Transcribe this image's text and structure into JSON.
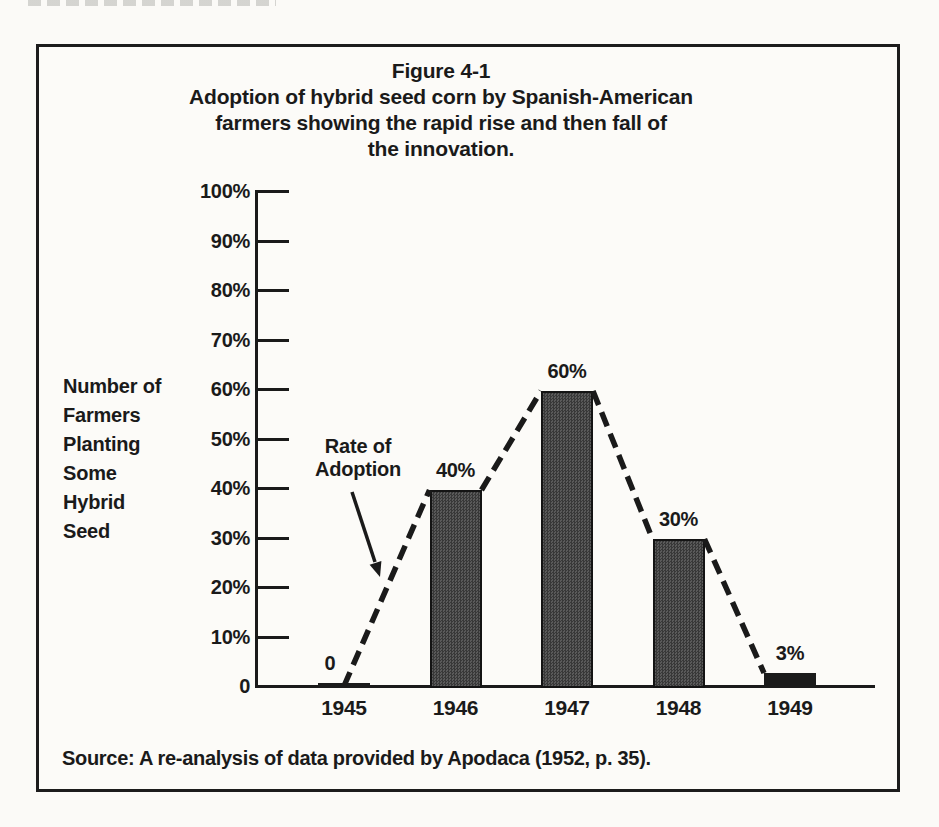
{
  "figure": {
    "number": "Figure 4-1",
    "caption_lines": [
      "Adoption of hybrid seed corn by Spanish-American",
      "farmers showing the rapid rise and then fall of",
      "the innovation."
    ],
    "source": "Source: A re-analysis of data provided by Apodaca (1952, p. 35)."
  },
  "chart_data": {
    "type": "bar",
    "title": "Figure 4-1",
    "subtitle": "Adoption of hybrid seed corn by Spanish-American farmers showing the rapid rise and then fall of the innovation.",
    "ylabel": "Number of Farmers Planting Some Hybrid Seed",
    "ylabel_lines": [
      "Number of",
      "Farmers",
      "Planting",
      "Some",
      "Hybrid",
      "Seed"
    ],
    "categories": [
      "1945",
      "1946",
      "1947",
      "1948",
      "1949"
    ],
    "values": [
      0,
      40,
      60,
      30,
      3
    ],
    "bar_labels": [
      "0",
      "40%",
      "60%",
      "30%",
      "3%"
    ],
    "yticks": [
      0,
      10,
      20,
      30,
      40,
      50,
      60,
      70,
      80,
      90,
      100
    ],
    "ytick_labels": [
      "0",
      "10%",
      "20%",
      "30%",
      "40%",
      "50%",
      "60%",
      "70%",
      "80%",
      "90%",
      "100%"
    ],
    "ylim": [
      0,
      100
    ],
    "grid": "off",
    "legend": "none",
    "annotation": {
      "label_lines": [
        "Rate of",
        "Adoption"
      ],
      "target": "dashed adoption curve"
    },
    "overlay_line": {
      "style": "dashed",
      "description": "Rate of Adoption curve connecting bar tops from 0% in 1945 up to 60% in 1947 and down to 3% in 1949"
    },
    "source": "Source: A re-analysis of data provided by Apodaca (1952, p. 35).",
    "colors": {
      "ink": "#1a1a1a",
      "bar_fill": "#4a4a4a",
      "paper": "#fbfaf7"
    }
  }
}
